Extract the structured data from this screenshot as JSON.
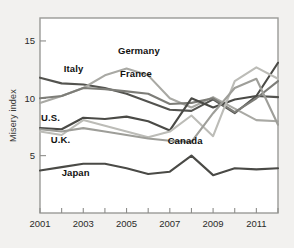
{
  "figure": {
    "background_color": "#f2f1ef",
    "plot_background_color": "#ffffff",
    "frame_color": "#9a9a97"
  },
  "axes": {
    "ylabel": "Misery index",
    "y_ticks": [
      "5",
      "10",
      "15"
    ],
    "x_ticks": [
      "2001",
      "2003",
      "2005",
      "2007",
      "2009",
      "2011"
    ]
  },
  "footnote": {
    "text": ""
  },
  "chart_data": {
    "type": "line",
    "title": "",
    "subtitle": "",
    "xlabel": "",
    "ylabel": "Misery index",
    "xlim": [
      2001,
      2012
    ],
    "ylim": [
      0,
      17
    ],
    "grid": false,
    "legend": "inline-labels",
    "x": [
      2001,
      2002,
      2003,
      2004,
      2005,
      2006,
      2007,
      2008,
      2009,
      2010,
      2011,
      2012
    ],
    "y_ticks": [
      5,
      10,
      15
    ],
    "x_ticks": [
      2001,
      2003,
      2005,
      2007,
      2009,
      2011
    ],
    "x_minor_ticks": [
      2002,
      2004,
      2006,
      2008,
      2010,
      2012
    ],
    "series": [
      {
        "name": "Italy",
        "color": "#53534f",
        "label_x": 2002.1,
        "label_y": 12.3,
        "values": [
          11.8,
          11.3,
          11.2,
          10.9,
          10.4,
          9.7,
          9.0,
          8.9,
          9.9,
          8.7,
          10.2,
          10.1
        ]
      },
      {
        "name": "Germany",
        "color": "#a9a9a4",
        "label_x": 2004.6,
        "label_y": 13.9,
        "values": [
          9.6,
          10.2,
          10.9,
          12.0,
          12.6,
          12.0,
          10.0,
          9.2,
          10.1,
          9.1,
          8.1,
          8.0
        ]
      },
      {
        "name": "France",
        "color": "#7d7d78",
        "label_x": 2004.7,
        "label_y": 11.9,
        "values": [
          10.0,
          10.2,
          10.9,
          10.8,
          10.6,
          10.4,
          9.5,
          9.6,
          10.0,
          8.8,
          10.0,
          11.5
        ]
      },
      {
        "name": "U.S.",
        "color": "#4a4a46",
        "label_x": 2001.05,
        "label_y": 8.0,
        "values": [
          7.4,
          7.3,
          8.3,
          8.2,
          8.4,
          8.0,
          7.2,
          10.0,
          9.2,
          9.9,
          10.2,
          13.1
        ]
      },
      {
        "name": "U.K.",
        "color": "#bcbcb7",
        "label_x": 2001.5,
        "label_y": 6.1,
        "values": [
          7.1,
          6.8,
          8.1,
          7.6,
          7.1,
          6.6,
          7.1,
          8.5,
          6.7,
          11.5,
          12.7,
          11.7
        ]
      },
      {
        "name": "Canada",
        "color": "#9e9e99",
        "label_x": 2006.9,
        "label_y": 6.0,
        "values": [
          7.3,
          7.1,
          7.4,
          7.1,
          6.8,
          6.5,
          6.3,
          6.2,
          8.7,
          10.9,
          11.7,
          7.7
        ]
      },
      {
        "name": "Japan",
        "color": "#4a4a46",
        "label_x": 2002.0,
        "label_y": 3.2,
        "values": [
          3.7,
          4.0,
          4.3,
          4.3,
          3.9,
          3.4,
          3.6,
          5.0,
          3.3,
          3.9,
          3.8,
          3.9
        ]
      }
    ]
  }
}
